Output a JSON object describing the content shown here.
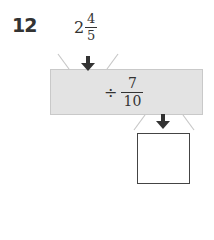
{
  "problem": {
    "number": "12",
    "input": {
      "whole": "2",
      "numerator": "4",
      "denominator": "5"
    },
    "operation": {
      "symbol": "÷",
      "numerator": "7",
      "denominator": "10"
    },
    "answer_box": ""
  },
  "colors": {
    "machine_fill": "#e3e3e3",
    "arrow": "#333333",
    "text": "#333333"
  }
}
